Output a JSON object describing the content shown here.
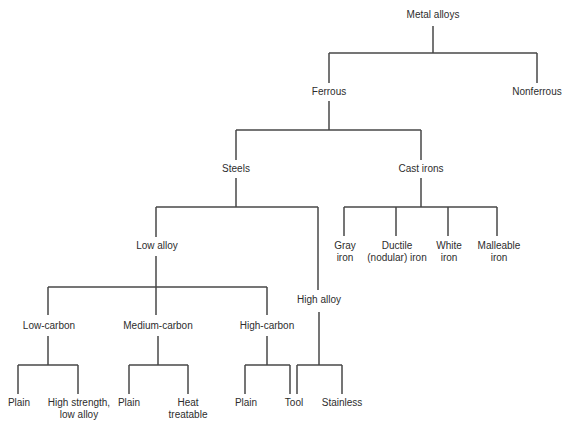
{
  "diagram": {
    "type": "tree",
    "root": "Metal alloys",
    "nodes": {
      "metal_alloys": {
        "label": [
          "Metal alloys"
        ]
      },
      "ferrous": {
        "label": [
          "Ferrous"
        ]
      },
      "nonferrous": {
        "label": [
          "Nonferrous"
        ]
      },
      "steels": {
        "label": [
          "Steels"
        ]
      },
      "cast_irons": {
        "label": [
          "Cast irons"
        ]
      },
      "low_alloy": {
        "label": [
          "Low alloy"
        ]
      },
      "high_alloy": {
        "label": [
          "High alloy"
        ]
      },
      "gray_iron": {
        "label": [
          "Gray",
          "iron"
        ]
      },
      "ductile_iron": {
        "label": [
          "Ductile",
          "(nodular) iron"
        ]
      },
      "white_iron": {
        "label": [
          "White",
          "iron"
        ]
      },
      "malleable_iron": {
        "label": [
          "Malleable",
          "iron"
        ]
      },
      "low_carbon": {
        "label": [
          "Low-carbon"
        ]
      },
      "medium_carbon": {
        "label": [
          "Medium-carbon"
        ]
      },
      "high_carbon": {
        "label": [
          "High-carbon"
        ]
      },
      "low_carbon_plain": {
        "label": [
          "Plain"
        ]
      },
      "hsla": {
        "label": [
          "High strength,",
          "low alloy"
        ]
      },
      "medium_carbon_plain": {
        "label": [
          "Plain"
        ]
      },
      "heat_treatable": {
        "label": [
          "Heat",
          "treatable"
        ]
      },
      "high_carbon_plain": {
        "label": [
          "Plain"
        ]
      },
      "tool": {
        "label": [
          "Tool"
        ]
      },
      "stainless": {
        "label": [
          "Stainless"
        ]
      }
    },
    "edges": [
      [
        "Metal alloys",
        "Ferrous"
      ],
      [
        "Metal alloys",
        "Nonferrous"
      ],
      [
        "Ferrous",
        "Steels"
      ],
      [
        "Ferrous",
        "Cast irons"
      ],
      [
        "Steels",
        "Low alloy"
      ],
      [
        "Steels",
        "High alloy"
      ],
      [
        "Cast irons",
        "Gray iron"
      ],
      [
        "Cast irons",
        "Ductile (nodular) iron"
      ],
      [
        "Cast irons",
        "White iron"
      ],
      [
        "Cast irons",
        "Malleable iron"
      ],
      [
        "Low alloy",
        "Low-carbon"
      ],
      [
        "Low alloy",
        "Medium-carbon"
      ],
      [
        "Low alloy",
        "High-carbon"
      ],
      [
        "Low-carbon",
        "Plain"
      ],
      [
        "Low-carbon",
        "High strength, low alloy"
      ],
      [
        "Medium-carbon",
        "Plain"
      ],
      [
        "Medium-carbon",
        "Heat treatable"
      ],
      [
        "High-carbon",
        "Plain"
      ],
      [
        "High-carbon",
        "Tool"
      ],
      [
        "High alloy",
        "Tool"
      ],
      [
        "High alloy",
        "Stainless"
      ]
    ],
    "line_color": "#474747",
    "text_color": "#2d2d2d"
  }
}
